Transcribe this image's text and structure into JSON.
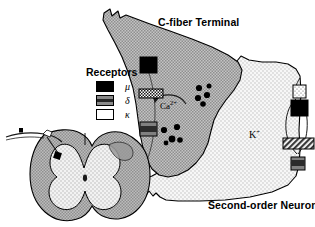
{
  "figure": {
    "type": "anatomical-diagram"
  },
  "labels": {
    "c_fiber_terminal": "C-fiber Terminal",
    "second_order_neuron": "Second-order Neuron",
    "calcium": "Ca",
    "calcium_charge": "2+",
    "potassium": "K",
    "potassium_charge": "+"
  },
  "legend": {
    "title": "Receptors",
    "items": [
      {
        "label": "μ",
        "name": "mu",
        "fill": "#000000",
        "pattern": "solid-black"
      },
      {
        "label": "δ",
        "name": "delta",
        "fill": "#808080",
        "pattern": "solid-gray"
      },
      {
        "label": "κ",
        "name": "kappa",
        "fill": "#ffffff",
        "pattern": "dotted-white"
      }
    ]
  },
  "colors": {
    "terminal_fill": "#b5b5b5",
    "neuron_fill": "#ececec",
    "white_matter": "#a8a8a8",
    "gray_matter": "#e4e4e4",
    "outline": "#000000",
    "mu": "#000000",
    "delta": "#808080",
    "kappa": "#ffffff",
    "channel_hatch": "#555555"
  },
  "presynaptic_receptors": [
    {
      "name": "mu-receptor-presynaptic-upper",
      "type": "μ",
      "fill": "#000000"
    },
    {
      "name": "calcium-channel",
      "type": "channel",
      "fill": "#ffffff",
      "pattern": "checker"
    },
    {
      "name": "delta-receptor-presynaptic-lower",
      "type": "δ",
      "fill": "#808080"
    }
  ],
  "postsynaptic_receptors": [
    {
      "name": "kappa-receptor-postsynaptic",
      "type": "κ",
      "fill": "#ffffff"
    },
    {
      "name": "mu-receptor-postsynaptic",
      "type": "μ",
      "fill": "#000000"
    },
    {
      "name": "potassium-channel",
      "type": "channel",
      "fill": "#555555",
      "pattern": "diagonal-hatch"
    },
    {
      "name": "delta-receptor-postsynaptic",
      "type": "δ",
      "fill": "#808080"
    }
  ],
  "vesicles": {
    "upper_cluster_count": 5,
    "lower_cluster_count": 5
  },
  "spinal_cord_inset": {
    "name": "spinal-cord-cross-section",
    "features": [
      "dorsal-root-afferent-fiber",
      "dorsal-root-ganglion-cell",
      "dorsal-horn-terminal",
      "butterfly-gray-matter"
    ]
  }
}
